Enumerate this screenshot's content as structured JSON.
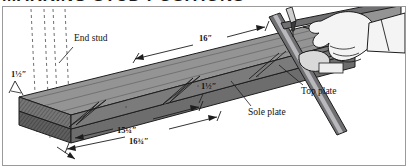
{
  "page": {
    "headline": "MARKING STUD POSITIONS"
  },
  "illustration": {
    "caption_labels": [
      {
        "id": "end-stud",
        "text": "End stud"
      },
      {
        "id": "top-plate",
        "text": "Top plate"
      },
      {
        "id": "sole-plate",
        "text": "Sole plate"
      }
    ],
    "dimension_labels": [
      {
        "id": "stock-thickness-left",
        "text": "1½″"
      },
      {
        "id": "on-center-spacing",
        "text": "16″"
      },
      {
        "id": "stud-thickness-mid",
        "text": "1½″"
      },
      {
        "id": "clear-span",
        "text": "15¼″"
      },
      {
        "id": "layout-mark",
        "text": "16¾″"
      }
    ],
    "labels": {
      "end_stud": "End stud",
      "top_plate": "Top plate",
      "sole_plate": "Sole plate",
      "dim_thickness_left": "1½″",
      "dim_sixteen": "16″",
      "dim_thickness_mid": "1½″",
      "dim_fifteen_quarter": "15¼″",
      "dim_sixteen_three_quarter": "16¾″"
    },
    "objects": [
      {
        "id": "top-plate-board",
        "kind": "lumber"
      },
      {
        "id": "sole-plate-board",
        "kind": "lumber"
      },
      {
        "id": "framing-square",
        "kind": "tool"
      },
      {
        "id": "pencil",
        "kind": "tool"
      },
      {
        "id": "hand",
        "kind": "body"
      },
      {
        "id": "layout-guide-lines",
        "kind": "annotation",
        "count": 4
      }
    ],
    "colors": {
      "board_face": "#8a8a8a",
      "board_face_light": "#9d9d9d",
      "board_edge": "#6d6d6d",
      "board_end_grain": "#6a6a6a",
      "outline": "#1d1d1d",
      "panel_border": "#9a9a9a",
      "background": "#ffffff",
      "tool_metal": "#58585a",
      "hand_fill": "#f2f2f2"
    }
  }
}
